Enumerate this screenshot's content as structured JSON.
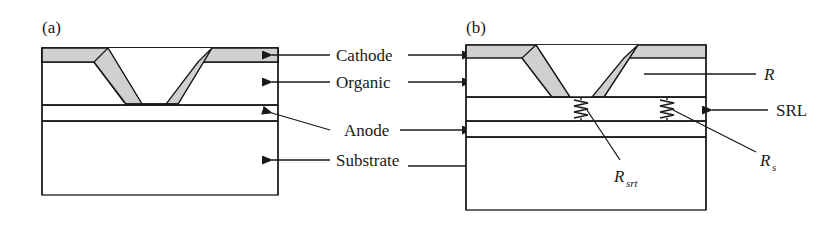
{
  "figure": {
    "type": "cross-section-device-schematic",
    "background_color": "#ffffff",
    "stroke_color": "#1a1a1a",
    "fill_gray": "#d0d0d0",
    "panels": [
      {
        "id": "a",
        "label": "(a)",
        "description": "OLED cross-section without shunt-resistance layer",
        "layers": [
          "Cathode",
          "Organic",
          "Anode",
          "Substrate"
        ]
      },
      {
        "id": "b",
        "label": "(b)",
        "description": "OLED cross-section with series resistance layer and equivalent resistors",
        "layers": [
          "Cathode",
          "Organic",
          "Anode",
          "Substrate",
          "SRL"
        ]
      }
    ],
    "center_labels": [
      {
        "text": "Cathode",
        "name": "cathode"
      },
      {
        "text": "Organic",
        "name": "organic"
      },
      {
        "text": "Anode",
        "name": "anode"
      },
      {
        "text": "Substrate",
        "name": "substrate"
      }
    ],
    "right_labels": [
      {
        "text": "R",
        "name": "resistance-r",
        "italic": true,
        "subscript": ""
      },
      {
        "text": "SRL",
        "name": "srl",
        "italic": false,
        "subscript": ""
      },
      {
        "text": "R",
        "name": "resistance-rs",
        "italic": true,
        "subscript": "s"
      }
    ],
    "inner_labels": [
      {
        "text": "R",
        "name": "resistance-rsrt",
        "italic": true,
        "subscript": "srt"
      }
    ]
  }
}
